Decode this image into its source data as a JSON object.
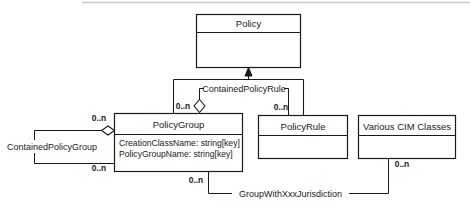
{
  "diagram": {
    "type": "uml-class-diagram",
    "classes": [
      {
        "id": "policy",
        "name": "Policy",
        "attributes": []
      },
      {
        "id": "policy-group",
        "name": "PolicyGroup",
        "attributes": [
          "CreationClassName: string[key]",
          "PolicyGroupName: string[key]"
        ]
      },
      {
        "id": "policy-rule",
        "name": "PolicyRule",
        "attributes": []
      },
      {
        "id": "various-cim-classes",
        "name": "Various CIM Classes",
        "attributes": []
      }
    ],
    "associations": [
      {
        "id": "contained-policy-rule",
        "label": "ContainedPolicyRule"
      },
      {
        "id": "contained-policy-group",
        "label": "ContainedPolicyGroup"
      },
      {
        "id": "group-with-xxx-jurisdiction",
        "label": "GroupWithXxxJurisdiction"
      }
    ],
    "multiplicities": {
      "aggregation_policygroup_top": "0..n",
      "policyrule_top": "0..n",
      "policygroup_self_upper": "0..n",
      "policygroup_self_lower": "0..n",
      "policygroup_bottom": "0..n",
      "various_cim_bottom": "0..n"
    }
  }
}
